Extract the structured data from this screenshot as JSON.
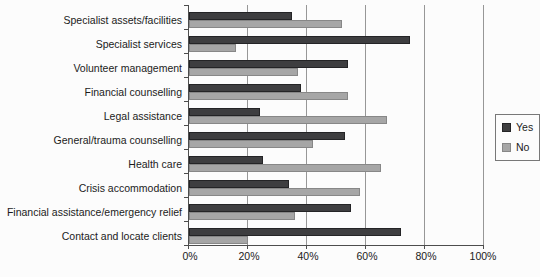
{
  "chart_data": {
    "type": "bar",
    "orientation": "horizontal",
    "title": "",
    "xlabel": "",
    "ylabel": "",
    "categories": [
      "Specialist assets/facilities",
      "Specialist services",
      "Volunteer management",
      "Financial counselling",
      "Legal assistance",
      "General/trauma counselling",
      "Health care",
      "Crisis accommodation",
      "Financial assistance/emergency relief",
      "Contact and locate clients"
    ],
    "series": [
      {
        "name": "Yes",
        "color": "#3e3e40",
        "border_color": "#242426",
        "values": [
          35,
          75,
          54,
          38,
          24,
          53,
          25,
          34,
          55,
          72
        ]
      },
      {
        "name": "No",
        "color": "#a6a6a6",
        "border_color": "#878787",
        "values": [
          52,
          16,
          37,
          54,
          67,
          42,
          65,
          58,
          36,
          20
        ]
      }
    ],
    "xlim": [
      0,
      100
    ],
    "x_tick_labels": [
      "0%",
      "20%",
      "40%",
      "60%",
      "80%",
      "100%"
    ],
    "grid": "vertical",
    "legend_position": "right",
    "colors": {
      "background": "#fcfcfc",
      "gridline": "#979797",
      "axis": "#4d4d4d",
      "text": "#1b1b1b"
    }
  }
}
